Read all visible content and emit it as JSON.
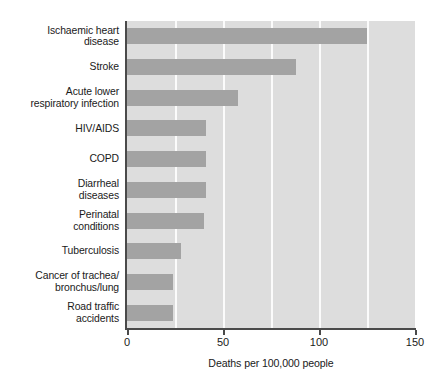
{
  "chart_data": {
    "type": "bar",
    "orientation": "horizontal",
    "title": "",
    "xlabel": "Deaths per 100,000 people",
    "ylabel": "",
    "xlim": [
      0,
      150
    ],
    "xticks": [
      "0",
      "50",
      "100",
      "150"
    ],
    "xtick_values": [
      0,
      50,
      100,
      150
    ],
    "gridlines": [
      25,
      50,
      75,
      100,
      125
    ],
    "grid": true,
    "legend": "none",
    "categories": [
      "Ischaemic heart\ndisease",
      "Stroke",
      "Acute lower\nrespiratory infection",
      "HIV/AIDS",
      "COPD",
      "Diarrheal\ndiseases",
      "Perinatal\nconditions",
      "Tuberculosis",
      "Cancer of trachea/\nbronchus/lung",
      "Road traffic\naccidents"
    ],
    "values": [
      125,
      88,
      58,
      41,
      41,
      41,
      40,
      28,
      24,
      24
    ],
    "colors": {
      "bar": "#a3a3a3",
      "plot_background": "#dddddd",
      "gridline": "#fbfbfb",
      "axis": "#4a4a4a",
      "text": "#1a1a1a",
      "page_background": "#ffffff"
    }
  }
}
